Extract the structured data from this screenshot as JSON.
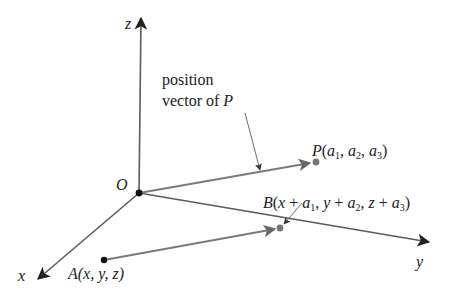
{
  "diagram": {
    "type": "3d-vector-translation",
    "axes": {
      "z": {
        "label": "z"
      },
      "x": {
        "label": "x"
      },
      "y": {
        "label": "y"
      },
      "origin": {
        "label": "O"
      }
    },
    "annotation": {
      "line1": "position",
      "line2_prefix": "vector of ",
      "line2_var": "P"
    },
    "points": {
      "P": {
        "name": "P",
        "open": "(",
        "a": "a",
        "s1": "1",
        "s2": "2",
        "s3": "3",
        "sep": ", ",
        "close": ")"
      },
      "A": {
        "name": "A",
        "text": "(x, y, z)"
      },
      "B": {
        "name": "B",
        "open": "(",
        "x": "x",
        "y": "y",
        "z": "z",
        "plus": " + ",
        "a": "a",
        "s1": "1",
        "s2": "2",
        "s3": "3",
        "sep": ", ",
        "close": ")"
      }
    },
    "colors": {
      "axis": "#5a5a5a",
      "vector": "#7a7a7a",
      "point_dark": "#111111",
      "point_gray": "#777777",
      "text": "#222222"
    }
  }
}
